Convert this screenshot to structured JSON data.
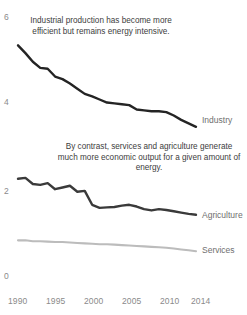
{
  "chart_data": {
    "type": "line",
    "title": "",
    "subtitle": "",
    "xlabel": "",
    "ylabel": "",
    "xlim": [
      1990,
      2014
    ],
    "ylim": [
      0,
      6
    ],
    "grid": false,
    "legend_position": "right-inline",
    "x": [
      1990,
      1991,
      1992,
      1993,
      1994,
      1995,
      1996,
      1997,
      1998,
      1999,
      2000,
      2001,
      2002,
      2003,
      2004,
      2005,
      2006,
      2007,
      2008,
      2009,
      2010,
      2011,
      2012,
      2013,
      2014
    ],
    "xticks": [
      1990,
      1995,
      2000,
      2005,
      2010,
      2014
    ],
    "xtick_labels": [
      "1990",
      "1995",
      "2000",
      "2005",
      "2010",
      "2014"
    ],
    "yticks": [
      0,
      2,
      4,
      6
    ],
    "ytick_labels": [
      "0",
      "2",
      "4",
      "6"
    ],
    "series": [
      {
        "name": "Industry",
        "color": "#242424",
        "values": [
          5.3,
          5.12,
          4.92,
          4.78,
          4.76,
          4.58,
          4.52,
          4.42,
          4.3,
          4.18,
          4.12,
          4.05,
          3.98,
          3.96,
          3.94,
          3.92,
          3.82,
          3.8,
          3.78,
          3.78,
          3.76,
          3.68,
          3.58,
          3.5,
          3.42
        ]
      },
      {
        "name": "Agriculture",
        "color": "#3a3a3a",
        "values": [
          2.22,
          2.24,
          2.1,
          2.08,
          2.12,
          1.98,
          2.02,
          2.06,
          1.92,
          1.94,
          1.62,
          1.55,
          1.56,
          1.57,
          1.6,
          1.62,
          1.58,
          1.52,
          1.49,
          1.52,
          1.5,
          1.47,
          1.44,
          1.41,
          1.39
        ]
      },
      {
        "name": "Services",
        "color": "#bcbcbc",
        "values": [
          0.8,
          0.8,
          0.78,
          0.78,
          0.77,
          0.76,
          0.76,
          0.75,
          0.74,
          0.73,
          0.72,
          0.71,
          0.71,
          0.7,
          0.69,
          0.68,
          0.67,
          0.66,
          0.65,
          0.64,
          0.63,
          0.61,
          0.59,
          0.57,
          0.55
        ]
      }
    ],
    "annotations": [
      {
        "id": "industry-note",
        "text": "Industrial production has become more efficient but remains energy intensive."
      },
      {
        "id": "services-agriculture-note",
        "text": "By contrast, services and agriculture generate much more economic output for a given amount of energy."
      }
    ]
  },
  "colors": {
    "background": "#ffffff",
    "axis_text": "#8a8a8a",
    "annotation_text": "#3d3d3d",
    "series_label_text": "#6f6f6f"
  }
}
